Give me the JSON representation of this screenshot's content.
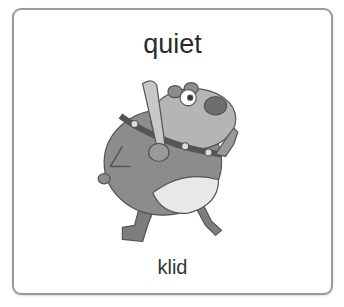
{
  "card": {
    "word": "quiet",
    "translation": "klid",
    "image": {
      "icon": "cartoon-bear-with-bat-illustration",
      "description": "Cartoon bear holding a baseball bat, finger raised to signal quiet"
    }
  },
  "colors": {
    "border": "#9a9a9a",
    "text": "#2b2b2b",
    "bear_body": "#8a8a8a",
    "bear_belly": "#e6e6e6",
    "bat": "#c4c4c4"
  }
}
